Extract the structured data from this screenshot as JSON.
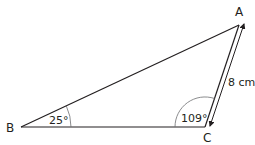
{
  "diagram": {
    "type": "triangle",
    "vertices": [
      {
        "id": "A",
        "label": "A"
      },
      {
        "id": "B",
        "label": "B"
      },
      {
        "id": "C",
        "label": "C"
      }
    ],
    "angles": [
      {
        "vertex": "B",
        "label": "25°"
      },
      {
        "vertex": "C",
        "label": "109°"
      }
    ],
    "sides": [
      {
        "from": "A",
        "to": "C",
        "label": "8 cm",
        "marker": "double-headed-arrow"
      }
    ],
    "colors": {
      "stroke": "#231f20",
      "arc": "#6d6e71",
      "background": "#ffffff"
    }
  }
}
